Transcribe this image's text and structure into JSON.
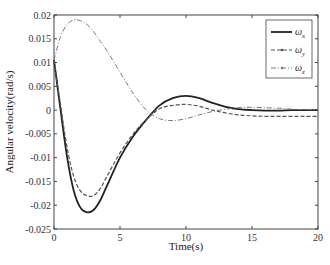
{
  "chart_data": {
    "type": "line",
    "title": "",
    "xlabel": "Time(s)",
    "ylabel": "Angular velocity(rad/s)",
    "xlim": [
      0,
      20
    ],
    "ylim": [
      -0.025,
      0.02
    ],
    "xticks": [
      "0",
      "5",
      "10",
      "15",
      "20"
    ],
    "yticks": [
      "0.02",
      "0.015",
      "0.01",
      "0.005",
      "0",
      "-0.005",
      "-0.01",
      "-0.015",
      "-0.02",
      "-0.025"
    ],
    "grid": false,
    "legend_position": "upper right",
    "x": [
      0,
      0.5,
      1,
      1.5,
      2,
      2.5,
      3,
      3.5,
      4,
      5,
      6,
      7,
      8,
      9,
      10,
      11,
      12,
      13,
      14,
      15,
      16,
      17,
      18,
      19,
      20
    ],
    "series": [
      {
        "name": "ωx",
        "style": "solid",
        "color": "#222222",
        "values": [
          0.0105,
          0.0,
          -0.01,
          -0.017,
          -0.0205,
          -0.0215,
          -0.021,
          -0.019,
          -0.016,
          -0.01,
          -0.0055,
          -0.002,
          0.001,
          0.0025,
          0.003,
          0.0025,
          0.0015,
          0.0007,
          0.0002,
          0.0,
          -0.0001,
          -0.0001,
          0.0,
          0.0,
          0.0
        ]
      },
      {
        "name": "ωy",
        "style": "dashed",
        "color": "#555555",
        "values": [
          0.0105,
          0.001,
          -0.008,
          -0.014,
          -0.017,
          -0.018,
          -0.018,
          -0.0165,
          -0.014,
          -0.009,
          -0.005,
          -0.002,
          0.0003,
          0.001,
          0.0012,
          0.0008,
          0.0,
          -0.0006,
          -0.001,
          -0.0012,
          -0.0013,
          -0.0013,
          -0.0013,
          -0.0013,
          -0.0013
        ]
      },
      {
        "name": "ωz",
        "style": "dash-dot",
        "color": "#777777",
        "values": [
          0.0105,
          0.0155,
          0.018,
          0.019,
          0.0188,
          0.018,
          0.0165,
          0.0145,
          0.0125,
          0.008,
          0.0035,
          0.0,
          -0.0018,
          -0.0022,
          -0.0018,
          -0.001,
          -0.0003,
          0.0002,
          0.0005,
          0.0006,
          0.0005,
          0.0004,
          0.0002,
          0.0001,
          0.0
        ]
      }
    ]
  },
  "legend": {
    "items": [
      {
        "label": "ωx",
        "sub": "x"
      },
      {
        "label": "ωy",
        "sub": "y"
      },
      {
        "label": "ωz",
        "sub": "z"
      }
    ]
  },
  "caption": "Fig. Angular velocity response of the spacecraft"
}
